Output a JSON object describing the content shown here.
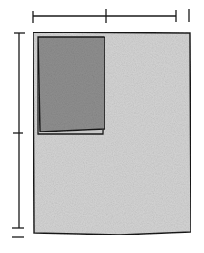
{
  "diagram": {
    "colors": {
      "background": "#ffffff",
      "sheet_fill": "#d4d4d4",
      "inner_rect_fill": "#8f8f8f",
      "stroke": "#1a1a1a"
    },
    "top_dimension": {
      "segments": 2
    },
    "left_dimension": {
      "segments": 2
    }
  }
}
